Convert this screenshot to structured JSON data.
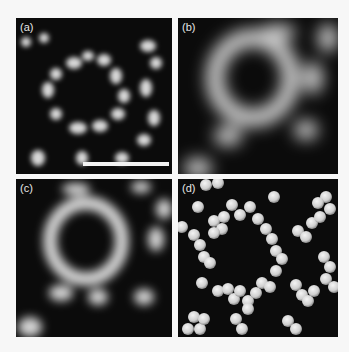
{
  "figure": {
    "panels": [
      {
        "id": "a",
        "label": "(a)",
        "description": "noisy STM-like image of bright blobs forming ring structure",
        "has_scale_bar": true
      },
      {
        "id": "b",
        "label": "(b)",
        "description": "smoothed/blurred image of ring structure"
      },
      {
        "id": "c",
        "label": "(c)",
        "description": "moderately smoothed image of ring structure"
      },
      {
        "id": "d",
        "label": "(d)",
        "description": "rendered spheres model forming chains and rings"
      }
    ],
    "colors": {
      "background": "#f7f7f7",
      "panel_bg": "#0b0b0b",
      "feature": "#e8e8e8",
      "scale_bar": "#f2f2f2"
    }
  }
}
